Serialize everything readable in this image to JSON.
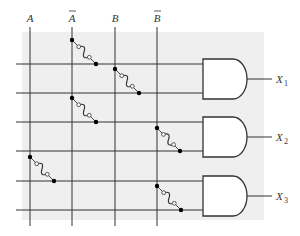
{
  "diagram": {
    "type": "programmable AND array (fusible links)",
    "inputs": [
      {
        "id": "A",
        "label": "A",
        "overbar": false,
        "x": 30
      },
      {
        "id": "Abar",
        "label": "A",
        "overbar": true,
        "x": 72
      },
      {
        "id": "B",
        "label": "B",
        "overbar": false,
        "x": 115
      },
      {
        "id": "Bbar",
        "label": "B",
        "overbar": true,
        "x": 157
      }
    ],
    "product_lines_y": [
      64,
      93,
      122,
      151,
      181,
      210
    ],
    "gates": [
      {
        "id": "gate1",
        "type": "AND",
        "top": 59,
        "bottom": 99,
        "output_label": "X",
        "output_sub": "1",
        "inputs_y": [
          64,
          93
        ]
      },
      {
        "id": "gate2",
        "type": "AND",
        "top": 117,
        "bottom": 157,
        "output_label": "X",
        "output_sub": "2",
        "inputs_y": [
          122,
          151
        ]
      },
      {
        "id": "gate3",
        "type": "AND",
        "top": 176,
        "bottom": 216,
        "output_label": "X",
        "output_sub": "3",
        "inputs_y": [
          181,
          210
        ]
      }
    ],
    "fuses": [
      {
        "from_input": "Abar",
        "line_index": 0,
        "x": 72,
        "y_start": 40
      },
      {
        "from_input": "B",
        "line_index": 1,
        "x": 115,
        "y_start": 69
      },
      {
        "from_input": "Abar",
        "line_index": 2,
        "x": 72,
        "y_start": 98
      },
      {
        "from_input": "Bbar",
        "line_index": 3,
        "x": 157,
        "y_start": 128
      },
      {
        "from_input": "A",
        "line_index": 4,
        "x": 30,
        "y_start": 157
      },
      {
        "from_input": "Bbar",
        "line_index": 5,
        "x": 157,
        "y_start": 186
      }
    ],
    "colors": {
      "panel": "#efefef",
      "line": "#333333",
      "gate_fill": "#ffffff"
    }
  }
}
